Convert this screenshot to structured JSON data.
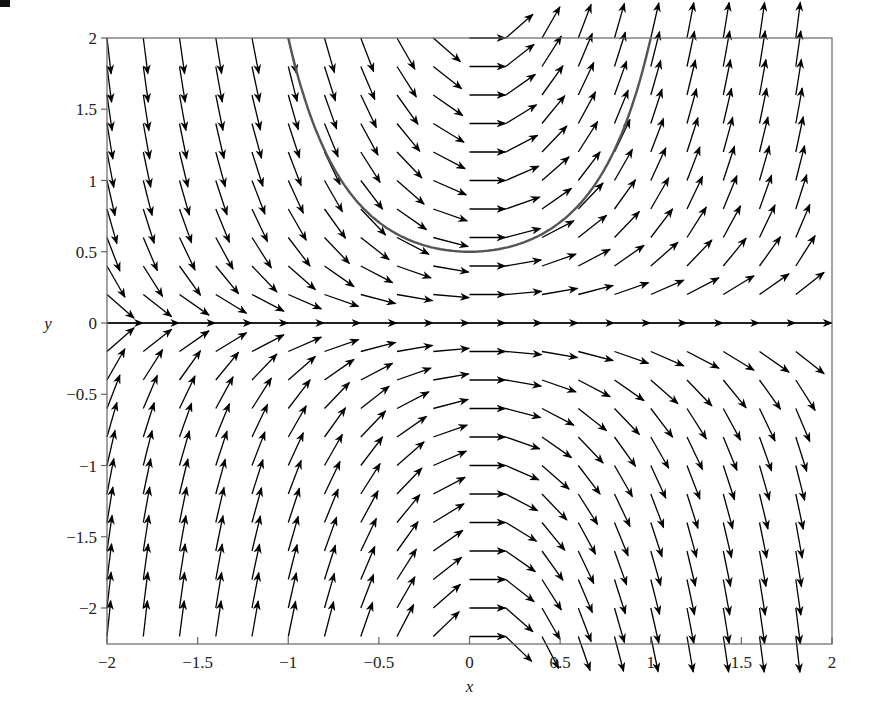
{
  "chart_data": {
    "type": "direction_field",
    "title": "",
    "xlabel": "x",
    "ylabel": "y",
    "xlim": [
      -2,
      2
    ],
    "ylim": [
      -2.24,
      2
    ],
    "x_ticks": [
      -2,
      -1.5,
      -1,
      -0.5,
      0,
      0.5,
      1,
      1.5,
      2
    ],
    "x_tick_labels": [
      "−2",
      "−1.5",
      "−1",
      "−0.5",
      "0",
      "0.5",
      "1",
      "1.5",
      "2"
    ],
    "y_ticks": [
      2,
      1.5,
      1,
      0.5,
      0,
      -0.5,
      -1,
      -1.5,
      -2
    ],
    "y_tick_labels": [
      "2",
      "1.5",
      "1",
      "0.5",
      "0",
      "−0.5",
      "−1",
      "−1.5",
      "−2"
    ],
    "grid": false,
    "legend": null,
    "field": {
      "equation": "dy/dx = 2 ln(4) x y",
      "coefficient": 2.7726,
      "grid_step": 0.2,
      "x_start": -2,
      "y_start": 2,
      "y_end": -2.2,
      "arrow_length_px": 36,
      "color": "#000000"
    },
    "solution_curve": {
      "equation": "y = 0.5 * 4^(x^2)",
      "initial_condition": {
        "x": 0,
        "y": 0.5
      },
      "x_range": [
        -1.0,
        1.0
      ],
      "color": "#555555",
      "samples": [
        {
          "x": -1.0,
          "y": 2.0
        },
        {
          "x": -0.8,
          "y": 1.21
        },
        {
          "x": -0.6,
          "y": 0.82
        },
        {
          "x": -0.4,
          "y": 0.62
        },
        {
          "x": -0.2,
          "y": 0.53
        },
        {
          "x": 0.0,
          "y": 0.5
        },
        {
          "x": 0.2,
          "y": 0.53
        },
        {
          "x": 0.4,
          "y": 0.62
        },
        {
          "x": 0.6,
          "y": 0.82
        },
        {
          "x": 0.8,
          "y": 1.21
        },
        {
          "x": 1.0,
          "y": 2.0
        }
      ]
    },
    "frame": {
      "left_px": 107,
      "right_px": 832,
      "top_px": 38,
      "bottom_px": 644,
      "y_zero_px": 323
    }
  }
}
